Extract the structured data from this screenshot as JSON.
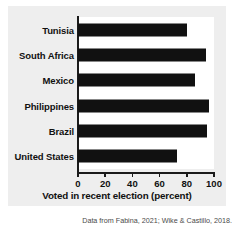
{
  "chart_data": {
    "type": "bar",
    "orientation": "horizontal",
    "title": "",
    "xlabel": "Voted in recent election (percent)",
    "ylabel": "",
    "categories": [
      "Tunisia",
      "South Africa",
      "Mexico",
      "Philippines",
      "Brazil",
      "United States"
    ],
    "values": [
      80,
      94,
      86,
      96,
      95,
      73
    ],
    "xlim": [
      0,
      100
    ],
    "xticks": [
      0,
      20,
      40,
      60,
      80,
      100
    ],
    "xtick_labels": [
      "0",
      "20",
      "40",
      "60",
      "80",
      "100"
    ],
    "grid": false,
    "legend": false,
    "bar_color": "#111111",
    "panel_color": "#eeeeee",
    "axis_color": "#1a1a1a"
  },
  "source_note": "Data from Fabina, 2021; Wike & Castillo, 2018."
}
